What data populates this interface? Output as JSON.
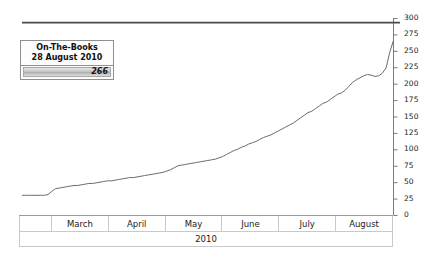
{
  "tooltip": {
    "title": "On-The-Books",
    "date": "28 August 2010",
    "value": "266"
  },
  "chart_data": {
    "type": "line",
    "title": "",
    "xlabel": "2010",
    "ylabel": "",
    "ylim": [
      0,
      300
    ],
    "yticks": [
      0,
      25,
      50,
      75,
      100,
      125,
      150,
      175,
      200,
      225,
      250,
      275,
      300
    ],
    "ytick_labels": [
      "0",
      "25",
      "50",
      "75",
      "100",
      "125",
      "150",
      "175",
      "200",
      "225",
      "250",
      "275",
      "300"
    ],
    "y_axis_position": "right",
    "grid": false,
    "legend": false,
    "categories": [
      "",
      "March",
      "April",
      "May",
      "June",
      "July",
      "August"
    ],
    "reference_line": {
      "value": 293,
      "color": "#4a4a4a"
    },
    "series": [
      {
        "name": "On-The-Books",
        "color": "#6b6b6b",
        "x": [
          0,
          1,
          2,
          3,
          4,
          5,
          6,
          7,
          8,
          9,
          10,
          11,
          12,
          13,
          14,
          15,
          16,
          17,
          18,
          19,
          20,
          21,
          22,
          23,
          24,
          25,
          26,
          27,
          28,
          29,
          30,
          31,
          32,
          33,
          34,
          35,
          36,
          37,
          38,
          39,
          40,
          41,
          42,
          43,
          44,
          45,
          46,
          47,
          48,
          49,
          50,
          51,
          52,
          53,
          54,
          55,
          56,
          57,
          58,
          59,
          60,
          61,
          62,
          63,
          64,
          65,
          66,
          67,
          68,
          69,
          70,
          71,
          72,
          73,
          74,
          75,
          76,
          77,
          78,
          79,
          80,
          81,
          82,
          83,
          84,
          85,
          86,
          87,
          88,
          89,
          90,
          91,
          92,
          93,
          94,
          95,
          96,
          97,
          98,
          99,
          100
        ],
        "values": [
          30,
          30,
          30,
          30,
          30,
          30,
          30,
          31,
          36,
          40,
          41,
          42,
          43,
          44,
          45,
          45,
          46,
          47,
          48,
          48,
          49,
          50,
          51,
          52,
          52,
          53,
          54,
          55,
          56,
          57,
          57,
          58,
          59,
          60,
          61,
          62,
          63,
          64,
          65,
          67,
          69,
          72,
          75,
          76,
          77,
          78,
          79,
          80,
          81,
          82,
          83,
          84,
          85,
          87,
          89,
          92,
          95,
          98,
          100,
          103,
          105,
          108,
          110,
          112,
          115,
          118,
          120,
          122,
          125,
          128,
          131,
          134,
          137,
          140,
          144,
          148,
          152,
          156,
          158,
          162,
          166,
          170,
          172,
          176,
          180,
          184,
          186,
          190,
          196,
          202,
          206,
          209,
          212,
          214,
          213,
          211,
          212,
          216,
          224,
          248,
          266
        ]
      }
    ]
  }
}
